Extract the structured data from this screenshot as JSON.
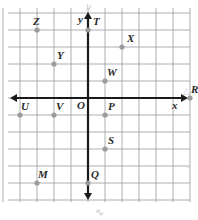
{
  "figure": {
    "type": "coordinate-plane",
    "title": "",
    "grid": {
      "visible": true,
      "spacing_px": 17,
      "color": "#9a9aa2",
      "x_min": -5,
      "x_max": 6,
      "y_min": -6,
      "y_max": 6
    },
    "origin_px": {
      "x": 88,
      "y": 98
    },
    "axes": {
      "x_label": "x",
      "y_label": "y",
      "color": "#1a1a1a",
      "arrows": [
        "left",
        "right",
        "up",
        "down"
      ]
    },
    "origin_label": "O",
    "point_color": "#9b9b9b",
    "label_color": "#2b2b2b"
  },
  "points": [
    {
      "name": "Z",
      "x": -3,
      "y": 4,
      "label_dx": -4,
      "label_dy": -14
    },
    {
      "name": "T",
      "x": 0,
      "y": 4,
      "label_dx": 5,
      "label_dy": -14
    },
    {
      "name": "X",
      "x": 2,
      "y": 3,
      "label_dx": 5,
      "label_dy": -14
    },
    {
      "name": "Y",
      "x": -2,
      "y": 2,
      "label_dx": 3,
      "label_dy": -14
    },
    {
      "name": "W",
      "x": 1,
      "y": 1,
      "label_dx": 2,
      "label_dy": -14
    },
    {
      "name": "R",
      "x": 6,
      "y": 0,
      "label_dx": 1,
      "label_dy": -14
    },
    {
      "name": "U",
      "x": -4,
      "y": -1,
      "label_dx": 1,
      "label_dy": -14
    },
    {
      "name": "V",
      "x": -2,
      "y": -1,
      "label_dx": 2,
      "label_dy": -14
    },
    {
      "name": "P",
      "x": 1,
      "y": -1,
      "label_dx": 3,
      "label_dy": -14
    },
    {
      "name": "S",
      "x": 1,
      "y": -3,
      "label_dx": 3,
      "label_dy": -14
    },
    {
      "name": "M",
      "x": -3,
      "y": -5,
      "label_dx": 1,
      "label_dy": -14
    },
    {
      "name": "Q",
      "x": 0,
      "y": -5,
      "label_dx": 3,
      "label_dy": -14
    }
  ],
  "annotations": {
    "top_scribble": "∨",
    "bottom_scribble": "∿",
    "right_triangle": "△"
  }
}
